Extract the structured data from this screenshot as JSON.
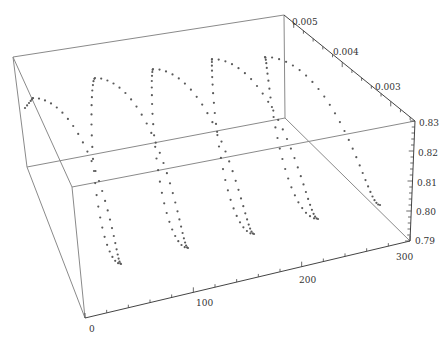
{
  "chart_data": {
    "type": "scatter",
    "subtype": "3d-point-plot",
    "title": "",
    "axes": {
      "x": {
        "label": "",
        "range": [
          0,
          300
        ],
        "ticks": [
          0,
          100,
          200,
          300
        ],
        "minor_step": 20
      },
      "y": {
        "label": "",
        "range": [
          0.0025,
          0.0052
        ],
        "ticks": [
          0.003,
          0.004,
          0.005
        ],
        "minor_step": 0.0002
      },
      "z": {
        "label": "",
        "range": [
          0.79,
          0.83
        ],
        "ticks": [
          0.79,
          0.8,
          0.81,
          0.82,
          0.83
        ],
        "minor_step": 0.002
      }
    },
    "series": [
      {
        "name": "helix-points",
        "color": "#5a5a5a",
        "loops": 5,
        "loop_tops_px": [
          [
            33,
            98
          ],
          [
            95,
            78
          ],
          [
            153,
            69
          ],
          [
            212,
            59
          ],
          [
            265,
            57
          ]
        ],
        "loop_bottoms_px": [
          [
            121,
            264
          ],
          [
            188,
            248
          ],
          [
            254,
            234
          ],
          [
            318,
            219
          ],
          [
            380,
            205
          ]
        ]
      }
    ],
    "grid": false,
    "legend": null,
    "box": true
  },
  "labels": {
    "x_ticks": [
      "0",
      "100",
      "200",
      "300"
    ],
    "y_ticks": [
      "0.005",
      "0.004",
      "0.003"
    ],
    "z_ticks": [
      "0.83",
      "0.82",
      "0.81",
      "0.80",
      "0.79"
    ]
  }
}
